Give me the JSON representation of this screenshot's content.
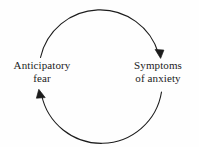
{
  "figure": {
    "type": "cycle-diagram",
    "background_color": "#fefefe",
    "stroke_color": "#1c1c1c",
    "text_color": "#1c1c1c"
  },
  "nodes": [
    {
      "id": "anticipatory-fear",
      "line1": "Anticipatory",
      "line2": "fear",
      "position": "left"
    },
    {
      "id": "symptoms-of-anxiety",
      "line1": "Symptoms",
      "line2": "of anxiety",
      "position": "right"
    }
  ],
  "arrows": [
    {
      "id": "top-arc",
      "from": "anticipatory-fear",
      "to": "symptoms-of-anxiety",
      "direction": "clockwise-over-top",
      "arrowhead": "end"
    },
    {
      "id": "bottom-arc",
      "from": "symptoms-of-anxiety",
      "to": "anticipatory-fear",
      "direction": "clockwise-under-bottom",
      "arrowhead": "end"
    }
  ]
}
